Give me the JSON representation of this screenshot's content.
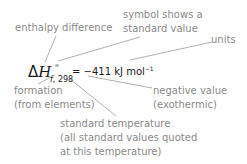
{
  "formula": {
    "delta": "Δ",
    "symbol": "H",
    "superscript": "⦵",
    "subscript_f": "f",
    "subscript_temp": ", 298",
    "equals": "=",
    "value": "−411",
    "unit": "kJ mol",
    "unit_exponent": "−1"
  },
  "annotations": {
    "enthalpy_difference": "enthalpy difference",
    "symbol_line1": "symbol shows a",
    "symbol_line2": "standard value",
    "units": "units",
    "formation_line1": "formation",
    "formation_line2": "(from elements)",
    "negative_line1": "negative value",
    "negative_line2": "(exothermic)",
    "temp_line1": "standard temperature",
    "temp_line2": "(all standard values quoted",
    "temp_line3": "at this temperature)"
  },
  "colors": {
    "label": "#8a8a8a",
    "formula": "#1a1a1a",
    "leader": "#9a9a9a"
  }
}
